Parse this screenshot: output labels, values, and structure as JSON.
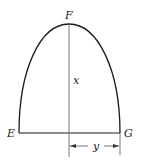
{
  "diagram": {
    "type": "parabolic-area",
    "labels": {
      "apex": "F",
      "left_corner": "E",
      "right_corner": "G",
      "height_var": "x",
      "half_width_var": "y"
    },
    "colors": {
      "stroke": "#1a1a1a",
      "thin_stroke": "#555555",
      "background": "#ffffff"
    }
  }
}
